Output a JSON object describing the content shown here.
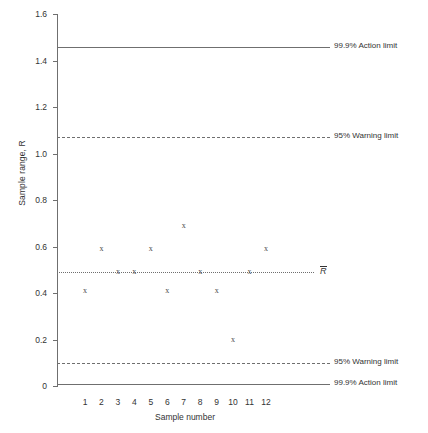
{
  "chart_data": {
    "type": "scatter",
    "title": "",
    "xlabel": "Sample number",
    "ylabel": "Sample range, R",
    "categories": [
      "1",
      "2",
      "3",
      "4",
      "5",
      "6",
      "7",
      "8",
      "9",
      "10",
      "11",
      "12"
    ],
    "x": [
      1,
      2,
      3,
      4,
      5,
      6,
      7,
      8,
      9,
      10,
      11,
      12
    ],
    "values": [
      0.41,
      0.59,
      0.49,
      0.49,
      0.59,
      0.41,
      0.69,
      0.49,
      0.41,
      0.2,
      0.49,
      0.59
    ],
    "series": [
      {
        "name": "Sample range",
        "marker": "x",
        "values": [
          0.41,
          0.59,
          0.49,
          0.49,
          0.59,
          0.41,
          0.69,
          0.49,
          0.41,
          0.2,
          0.49,
          0.59
        ]
      }
    ],
    "xlim": [
      0.4,
      12.6
    ],
    "ylim": [
      0,
      1.6
    ],
    "ytick_labels": [
      "0",
      "0.2",
      "0.4",
      "0.6",
      "0.8",
      "1.0",
      "1.2",
      "1.4",
      "1.6"
    ],
    "ytick_values": [
      0,
      0.2,
      0.4,
      0.6,
      0.8,
      1.0,
      1.2,
      1.4,
      1.6
    ],
    "xtick_labels": [
      "1",
      "2",
      "3",
      "4",
      "5",
      "6",
      "7",
      "8",
      "9",
      "10",
      "11",
      "12"
    ],
    "grid": false,
    "legend": "inline-right-labels",
    "reference_lines": [
      {
        "id": "upper-action",
        "label": "99.9% Action limit",
        "value": 1.46,
        "style": "solid"
      },
      {
        "id": "upper-warning",
        "label": "95% Warning limit",
        "value": 1.07,
        "style": "dashed"
      },
      {
        "id": "center-line",
        "label": "R̄",
        "value": 0.49,
        "style": "dotted"
      },
      {
        "id": "lower-warning",
        "label": "95% Warning limit",
        "value": 0.1,
        "style": "dashed"
      },
      {
        "id": "lower-action",
        "label": "99.9% Action limit",
        "value": 0.01,
        "style": "solid"
      }
    ]
  },
  "axes": {
    "y_title": "Sample range, R",
    "x_title": "Sample number"
  },
  "labels": {
    "upper_action": "99.9% Action limit",
    "upper_warning": "95% Warning limit",
    "center": "R",
    "lower_warning": "95% Warning limit",
    "lower_action": "99.9% Action limit"
  },
  "colors": {
    "line": "#6f6f6f",
    "text": "#333333",
    "marker": "#4a4a4a",
    "background": "#ffffff"
  }
}
